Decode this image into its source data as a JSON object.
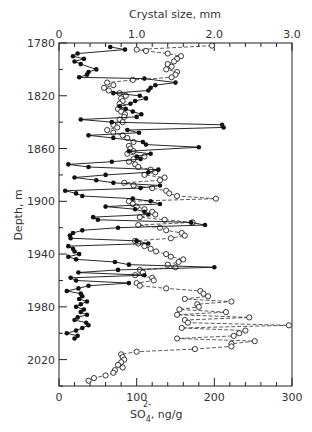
{
  "chart_data": {
    "type": "scatter",
    "title": "",
    "top_axis": {
      "label": "Crystal size, mm",
      "ticks": [
        "0",
        "1.0",
        "2.0",
        "3.0"
      ],
      "range": [
        0,
        3.0
      ]
    },
    "bottom_axis": {
      "label_main": "SO",
      "label_sub": "4",
      "label_sup": "2-",
      "label_unit": ",  ng/g",
      "ticks": [
        "0",
        "100",
        "200",
        "300"
      ],
      "range": [
        0,
        300
      ]
    },
    "y_axis": {
      "label": "Depth, m",
      "ticks": [
        "1780",
        "1820",
        "1860",
        "1900",
        "1940",
        "1980",
        "2020"
      ],
      "range": [
        1780,
        2040
      ],
      "inverted": true
    },
    "series": [
      {
        "name": "SO4 2- (ng/g)",
        "marker": "filled-circle",
        "line": "solid",
        "axis": "bottom",
        "points": [
          [
            1783,
            66
          ],
          [
            1785,
            85
          ],
          [
            1788,
            24
          ],
          [
            1790,
            18
          ],
          [
            1792,
            32
          ],
          [
            1794,
            20
          ],
          [
            1796,
            28
          ],
          [
            1800,
            48
          ],
          [
            1802,
            38
          ],
          [
            1804,
            36
          ],
          [
            1806,
            26
          ],
          [
            1807,
            110
          ],
          [
            1810,
            150
          ],
          [
            1812,
            124
          ],
          [
            1814,
            118
          ],
          [
            1816,
            115
          ],
          [
            1818,
            70
          ],
          [
            1820,
            104
          ],
          [
            1822,
            112
          ],
          [
            1824,
            98
          ],
          [
            1826,
            92
          ],
          [
            1828,
            78
          ],
          [
            1830,
            86
          ],
          [
            1832,
            95
          ],
          [
            1834,
            106
          ],
          [
            1836,
            100
          ],
          [
            1838,
            28
          ],
          [
            1840,
            68
          ],
          [
            1842,
            210
          ],
          [
            1844,
            212
          ],
          [
            1846,
            88
          ],
          [
            1848,
            103
          ],
          [
            1850,
            38
          ],
          [
            1852,
            70
          ],
          [
            1855,
            108
          ],
          [
            1857,
            112
          ],
          [
            1859,
            180
          ],
          [
            1862,
            90
          ],
          [
            1864,
            118
          ],
          [
            1866,
            100
          ],
          [
            1868,
            105
          ],
          [
            1870,
            68
          ],
          [
            1872,
            12
          ],
          [
            1874,
            38
          ],
          [
            1876,
            128
          ],
          [
            1878,
            115
          ],
          [
            1880,
            60
          ],
          [
            1882,
            20
          ],
          [
            1884,
            48
          ],
          [
            1886,
            70
          ],
          [
            1888,
            130
          ],
          [
            1890,
            105
          ],
          [
            1892,
            8
          ],
          [
            1894,
            22
          ],
          [
            1896,
            30
          ],
          [
            1898,
            95
          ],
          [
            1900,
            118
          ],
          [
            1902,
            130
          ],
          [
            1904,
            60
          ],
          [
            1906,
            98
          ],
          [
            1908,
            110
          ],
          [
            1910,
            115
          ],
          [
            1912,
            44
          ],
          [
            1914,
            50
          ],
          [
            1916,
            170
          ],
          [
            1918,
            188
          ],
          [
            1920,
            76
          ],
          [
            1922,
            30
          ],
          [
            1924,
            18
          ],
          [
            1926,
            14
          ],
          [
            1928,
            15
          ],
          [
            1930,
            100
          ],
          [
            1932,
            115
          ],
          [
            1934,
            12
          ],
          [
            1936,
            18
          ],
          [
            1938,
            20
          ],
          [
            1940,
            26
          ],
          [
            1942,
            12
          ],
          [
            1944,
            22
          ],
          [
            1946,
            72
          ],
          [
            1948,
            90
          ],
          [
            1950,
            200
          ],
          [
            1952,
            76
          ],
          [
            1954,
            25
          ],
          [
            1956,
            110
          ],
          [
            1958,
            15
          ],
          [
            1960,
            22
          ],
          [
            1962,
            90
          ],
          [
            1964,
            38
          ],
          [
            1966,
            25
          ],
          [
            1968,
            10
          ],
          [
            1970,
            28
          ],
          [
            1972,
            30
          ],
          [
            1974,
            26
          ],
          [
            1976,
            36
          ],
          [
            1978,
            28
          ],
          [
            1980,
            22
          ],
          [
            1982,
            32
          ],
          [
            1984,
            28
          ],
          [
            1986,
            36
          ],
          [
            1988,
            24
          ],
          [
            1990,
            20
          ],
          [
            1992,
            35
          ],
          [
            1994,
            38
          ],
          [
            1996,
            30
          ],
          [
            1998,
            22
          ],
          [
            2000,
            10
          ],
          [
            2002,
            24
          ],
          [
            2004,
            20
          ]
        ]
      },
      {
        "name": "Crystal size (mm)",
        "marker": "open-circle",
        "line": "dashed",
        "axis": "top",
        "points": [
          [
            1782,
            1.97
          ],
          [
            1785,
            1.0
          ],
          [
            1786,
            1.12
          ],
          [
            1788,
            1.4
          ],
          [
            1790,
            1.57
          ],
          [
            1792,
            1.52
          ],
          [
            1794,
            1.48
          ],
          [
            1796,
            1.4
          ],
          [
            1798,
            1.45
          ],
          [
            1800,
            1.38
          ],
          [
            1802,
            1.52
          ],
          [
            1804,
            1.5
          ],
          [
            1806,
            1.45
          ],
          [
            1808,
            0.95
          ],
          [
            1810,
            0.62
          ],
          [
            1812,
            0.7
          ],
          [
            1814,
            0.58
          ],
          [
            1816,
            0.64
          ],
          [
            1818,
            0.78
          ],
          [
            1820,
            0.86
          ],
          [
            1822,
            0.8
          ],
          [
            1824,
            0.82
          ],
          [
            1826,
            0.78
          ],
          [
            1828,
            0.82
          ],
          [
            1830,
            0.76
          ],
          [
            1832,
            0.8
          ],
          [
            1834,
            0.85
          ],
          [
            1836,
            0.84
          ],
          [
            1838,
            0.78
          ],
          [
            1840,
            0.82
          ],
          [
            1842,
            0.7
          ],
          [
            1844,
            0.75
          ],
          [
            1846,
            0.62
          ],
          [
            1848,
            0.7
          ],
          [
            1850,
            0.82
          ],
          [
            1852,
            0.88
          ],
          [
            1855,
            0.96
          ],
          [
            1858,
            0.9
          ],
          [
            1860,
            0.92
          ],
          [
            1862,
            0.96
          ],
          [
            1864,
            0.88
          ],
          [
            1866,
            1.1
          ],
          [
            1868,
            0.96
          ],
          [
            1870,
            0.9
          ],
          [
            1872,
            0.98
          ],
          [
            1874,
            1.02
          ],
          [
            1876,
            1.18
          ],
          [
            1878,
            1.24
          ],
          [
            1880,
            1.1
          ],
          [
            1882,
            1.36
          ],
          [
            1884,
            1.3
          ],
          [
            1886,
            0.84
          ],
          [
            1888,
            0.96
          ],
          [
            1890,
            1.2
          ],
          [
            1892,
            1.38
          ],
          [
            1894,
            1.42
          ],
          [
            1896,
            1.52
          ],
          [
            1898,
            2.02
          ],
          [
            1900,
            0.9
          ],
          [
            1902,
            0.95
          ],
          [
            1904,
            1.0
          ],
          [
            1906,
            1.1
          ],
          [
            1908,
            1.2
          ],
          [
            1910,
            1.24
          ],
          [
            1912,
            1.04
          ],
          [
            1914,
            1.36
          ],
          [
            1916,
            1.72
          ],
          [
            1918,
            1.02
          ],
          [
            1920,
            1.3
          ],
          [
            1922,
            1.38
          ],
          [
            1924,
            1.58
          ],
          [
            1926,
            1.62
          ],
          [
            1928,
            1.44
          ],
          [
            1930,
            0.98
          ],
          [
            1932,
            1.02
          ],
          [
            1934,
            1.1
          ],
          [
            1936,
            1.18
          ],
          [
            1938,
            1.25
          ],
          [
            1940,
            1.38
          ],
          [
            1942,
            1.44
          ],
          [
            1944,
            1.6
          ],
          [
            1946,
            1.54
          ],
          [
            1948,
            1.4
          ],
          [
            1950,
            1.5
          ],
          [
            1952,
            1.04
          ],
          [
            1954,
            1.08
          ],
          [
            1956,
            0.98
          ],
          [
            1958,
            1.2
          ],
          [
            1960,
            1.22
          ],
          [
            1962,
            1.0
          ],
          [
            1964,
            1.04
          ],
          [
            1966,
            1.38
          ],
          [
            1968,
            1.82
          ],
          [
            1970,
            1.86
          ],
          [
            1972,
            1.92
          ],
          [
            1974,
            1.62
          ],
          [
            1976,
            2.22
          ],
          [
            1978,
            1.78
          ],
          [
            1980,
            1.8
          ],
          [
            1982,
            1.55
          ],
          [
            1984,
            2.15
          ],
          [
            1986,
            1.52
          ],
          [
            1988,
            2.45
          ],
          [
            1990,
            1.62
          ],
          [
            1992,
            1.66
          ],
          [
            1994,
            2.96
          ],
          [
            1996,
            1.58
          ],
          [
            1998,
            2.4
          ],
          [
            2000,
            2.32
          ],
          [
            2002,
            2.25
          ],
          [
            2004,
            1.52
          ],
          [
            2006,
            2.52
          ],
          [
            2008,
            2.22
          ],
          [
            2010,
            2.22
          ],
          [
            2012,
            1.75
          ],
          [
            2014,
            1.0
          ],
          [
            2016,
            0.8
          ],
          [
            2018,
            0.82
          ],
          [
            2020,
            0.84
          ],
          [
            2022,
            0.8
          ],
          [
            2024,
            0.76
          ],
          [
            2026,
            0.82
          ],
          [
            2028,
            0.72
          ],
          [
            2030,
            0.7
          ],
          [
            2032,
            0.6
          ],
          [
            2034,
            0.45
          ],
          [
            2036,
            0.38
          ]
        ]
      }
    ],
    "grid": false,
    "legend": "none"
  }
}
